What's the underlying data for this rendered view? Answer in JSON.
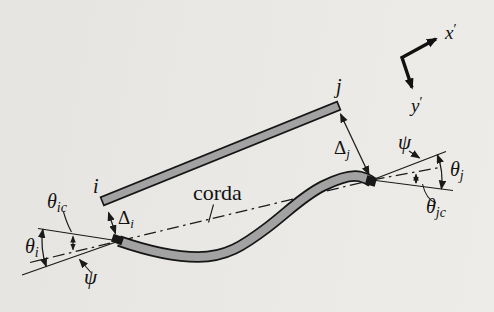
{
  "figure": {
    "background_color": "#e9e8e4",
    "member_fill_color": "#a2a2a2",
    "line_color": "#1a1a1a"
  },
  "axes": {
    "x": {
      "base": "x",
      "prime": "′"
    },
    "y": {
      "base": "y",
      "prime": "′"
    }
  },
  "nodes": {
    "i": "i",
    "j": "j"
  },
  "displacements": {
    "delta_i": {
      "base": "Δ",
      "sub": "i"
    },
    "delta_j": {
      "base": "Δ",
      "sub": "j"
    }
  },
  "angles": {
    "theta_i": {
      "base": "θ",
      "sub": "i"
    },
    "theta_ic": {
      "base": "θ",
      "sub": "ic"
    },
    "theta_j": {
      "base": "θ",
      "sub": "j"
    },
    "theta_jc": {
      "base": "θ",
      "sub": "jc"
    },
    "psi_left": "ψ",
    "psi_right": "ψ"
  },
  "chord": {
    "label": "corda"
  }
}
